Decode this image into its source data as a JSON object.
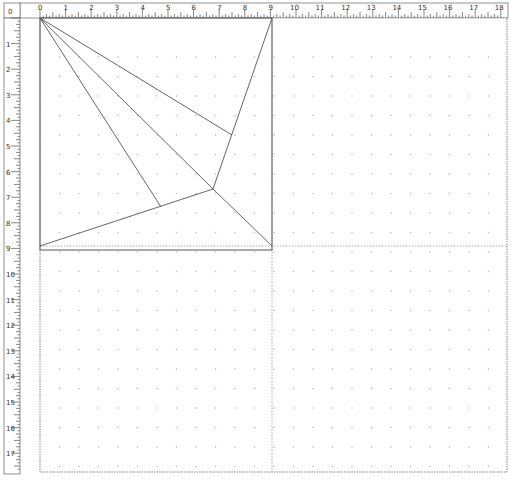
{
  "rulers": {
    "unit_px": 25.6,
    "top": {
      "labels": [
        "0",
        "1",
        "2",
        "3",
        "4",
        "5",
        "6",
        "7",
        "8",
        "9",
        "10",
        "11",
        "12",
        "13",
        "14",
        "15",
        "16",
        "17",
        "18"
      ]
    },
    "left": {
      "labels": [
        "0",
        "1",
        "2",
        "3",
        "4",
        "5",
        "6",
        "7",
        "8",
        "9",
        "10",
        "11",
        "12",
        "13",
        "14",
        "15",
        "16",
        "17",
        "18"
      ]
    }
  },
  "page": {
    "left": 40,
    "top": 18,
    "right": 507,
    "bottom": 472,
    "divider_x": 272,
    "divider_y": 246
  },
  "drawing": {
    "square": {
      "x": 40,
      "y": 18,
      "size": 232
    },
    "points": {
      "TL": [
        40,
        18
      ],
      "TR": [
        272,
        18
      ],
      "BL": [
        40,
        246
      ],
      "BR": [
        272,
        246
      ],
      "V": [
        213,
        189
      ],
      "P1": [
        232,
        135
      ],
      "P2": [
        161,
        207
      ]
    },
    "segments": [
      [
        "TL",
        "P1"
      ],
      [
        "TL",
        "V"
      ],
      [
        "TL",
        "P2"
      ],
      [
        "BL",
        "V"
      ],
      [
        "V",
        "BR"
      ],
      [
        "TR",
        "V"
      ]
    ],
    "stroke_color": "#555555"
  },
  "grid": {
    "dot_spacing": 19.5,
    "dot_color": "#bbbbbb"
  }
}
